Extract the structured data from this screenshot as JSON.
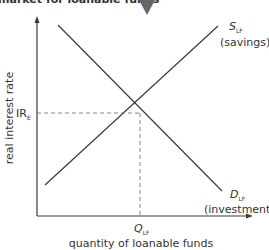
{
  "header": {
    "cropped_title": "market for loanable funds"
  },
  "diagram": {
    "y_axis_label": "real interest rate",
    "x_axis_label": "quantity of loanable funds",
    "equilibrium_rate_label": "IR",
    "equilibrium_rate_sub": "E",
    "equilibrium_quantity_label": "Q",
    "equilibrium_quantity_sub": "LF",
    "supply_label": "S",
    "supply_sub": "LF",
    "supply_desc": "(savings)",
    "demand_label": "D",
    "demand_sub": "LF",
    "demand_desc": "(investment)"
  },
  "colors": {
    "line": "#3a3a3a",
    "text": "#333333",
    "marker": "#666666",
    "dashed": "#777777"
  }
}
